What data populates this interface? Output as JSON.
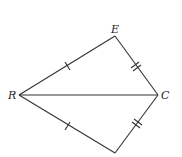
{
  "figure": {
    "type": "kite geometry diagram",
    "vertices": {
      "R": {
        "label": "R",
        "x": 19,
        "y": 95
      },
      "E": {
        "label": "E",
        "x": 115,
        "y": 36
      },
      "C": {
        "label": "C",
        "x": 158,
        "y": 95
      },
      "bottom": {
        "label": "",
        "x": 115,
        "y": 153
      }
    },
    "segments": [
      {
        "from": "R",
        "to": "E",
        "ticks": 1
      },
      {
        "from": "E",
        "to": "C",
        "ticks": 2
      },
      {
        "from": "R",
        "to": "C",
        "ticks": 0
      },
      {
        "from": "R",
        "to": "bottom",
        "ticks": 1
      },
      {
        "from": "bottom",
        "to": "C",
        "ticks": 2
      }
    ],
    "line_color": "#333333"
  }
}
